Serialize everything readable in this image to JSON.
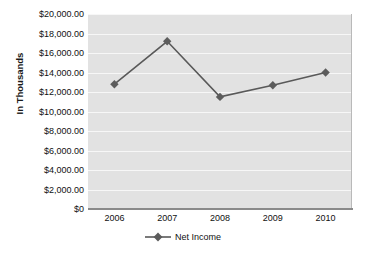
{
  "chart_data": {
    "type": "line",
    "title": "",
    "xlabel": "",
    "ylabel": "In Thousands",
    "categories": [
      "2006",
      "2007",
      "2008",
      "2009",
      "2010"
    ],
    "series": [
      {
        "name": "Net Income",
        "values": [
          12800,
          17200,
          11500,
          12700,
          14000
        ]
      }
    ],
    "ylim": [
      0,
      20000
    ],
    "y_tick_values": [
      0,
      2000,
      4000,
      6000,
      8000,
      10000,
      12000,
      14000,
      16000,
      18000,
      20000
    ],
    "y_tick_labels": [
      "$0",
      "$2,000.00",
      "$4,000.00",
      "$6,000.00",
      "$8,000.00",
      "$10,000.00",
      "$12,000.00",
      "$14,000.00",
      "$16,000.00",
      "$18,000.00",
      "$20,000.00"
    ],
    "grid": true,
    "legend_position": "bottom",
    "marker": "diamond",
    "colors": {
      "line": "#595959",
      "marker": "#5c5c5c",
      "plot_background": "#e2e2e2",
      "gridline": "#f7f7f7",
      "axis": "#8a8a8a",
      "text": "#111111"
    }
  },
  "legend": {
    "entries": [
      {
        "label": "Net Income"
      }
    ]
  }
}
